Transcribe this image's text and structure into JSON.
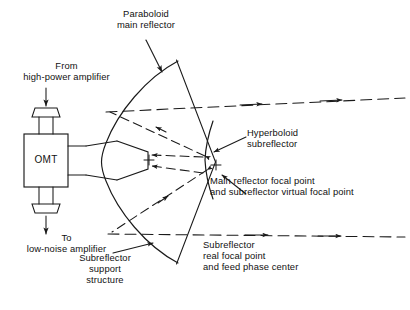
{
  "figure": {
    "type": "schematic-diagram",
    "background_color": "#ffffff",
    "line_color": "#1a1a1a"
  },
  "labels": {
    "paraboloid_main_reflector": "Paraboloid\nmain reflector",
    "from_high_power_amplifier": "From\nhigh-power amplifier",
    "to_low_noise_amplifier": "To\nlow-noise amplifier",
    "hyperboloid_subreflector": "Hyperboloid\nsubreflector",
    "main_reflector_focal_point": "Main reflector focal point\nand subreflector virtual focal point",
    "subreflector_real_focal_point": "Subreflector\nreal focal point\nand feed phase center",
    "subreflector_support_structure": "Subreflector\nsupport\nstructure",
    "omt": "OMT"
  },
  "components": [
    {
      "name": "paraboloid-main-reflector",
      "shape": "parabolic-arc"
    },
    {
      "name": "hyperboloid-subreflector",
      "shape": "hyperbolic-arc"
    },
    {
      "name": "feed-horn",
      "shape": "flared-horn"
    },
    {
      "name": "omt-box",
      "shape": "rectangle"
    },
    {
      "name": "waveguide-flange-top",
      "shape": "flanged-stub"
    },
    {
      "name": "waveguide-flange-bottom",
      "shape": "flanged-stub"
    },
    {
      "name": "subreflector-support-strut-upper",
      "shape": "line"
    },
    {
      "name": "subreflector-support-strut-lower",
      "shape": "line"
    }
  ],
  "markers": {
    "focal_point_cross_feed": "+",
    "focal_point_cross_main": "+"
  },
  "ray_paths": [
    {
      "name": "feed-to-subreflector-upper",
      "style": "dashed",
      "arrow": true
    },
    {
      "name": "feed-to-subreflector-lower",
      "style": "dashed",
      "arrow": true
    },
    {
      "name": "subreflector-to-main-upper",
      "style": "dashed",
      "arrow": true
    },
    {
      "name": "subreflector-to-main-lower",
      "style": "dashed",
      "arrow": true
    },
    {
      "name": "main-axis-outgoing",
      "style": "dash-dot-axis",
      "arrow": true
    },
    {
      "name": "aperture-ray-upper",
      "style": "dashed",
      "arrow": true
    },
    {
      "name": "aperture-ray-lower",
      "style": "dashed",
      "arrow": true
    }
  ]
}
